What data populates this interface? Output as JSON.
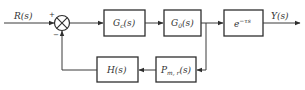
{
  "diagram": {
    "type": "feedback-control-block-diagram",
    "input_signal": "R(s)",
    "output_signal": "Y(s)",
    "summing_junction": {
      "plus_sign": "+",
      "minus_sign": "−"
    },
    "blocks": {
      "controller": {
        "base": "G",
        "subscript": "c",
        "arg": "(s)"
      },
      "plant": {
        "base": "G",
        "subscript": "0",
        "arg": "(s)"
      },
      "delay": {
        "base": "e",
        "superscript": "−τs"
      },
      "measurement": {
        "base": "P",
        "subscript": "m, r",
        "arg": "(s)"
      },
      "feedback": {
        "text": "H(s)"
      }
    }
  }
}
